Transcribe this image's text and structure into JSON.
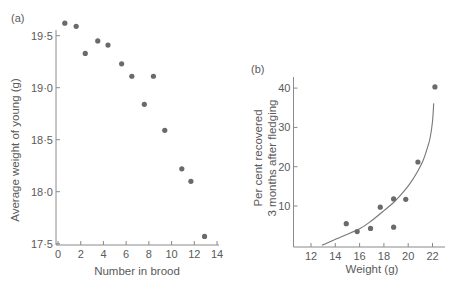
{
  "chart_data": [
    {
      "panel": "(a)",
      "type": "scatter",
      "title": "",
      "xlabel": "Number in brood",
      "ylabel": "Average weight of young (g)",
      "xlim": [
        0,
        14
      ],
      "ylim": [
        17.5,
        19.7
      ],
      "xticks": [
        "0",
        "2",
        "4",
        "6",
        "8",
        "10",
        "12",
        "14"
      ],
      "yticks": [
        "17·5",
        "18·0",
        "18·5",
        "19·0",
        "19·5"
      ],
      "grid": false,
      "legend": null,
      "series": [
        {
          "name": "broods",
          "points": [
            {
              "x": 0.6,
              "y": 19.62
            },
            {
              "x": 1.6,
              "y": 19.59
            },
            {
              "x": 2.4,
              "y": 19.33
            },
            {
              "x": 3.5,
              "y": 19.45
            },
            {
              "x": 4.4,
              "y": 19.41
            },
            {
              "x": 5.6,
              "y": 19.23
            },
            {
              "x": 6.5,
              "y": 19.11
            },
            {
              "x": 7.6,
              "y": 18.84
            },
            {
              "x": 8.4,
              "y": 19.11
            },
            {
              "x": 9.4,
              "y": 18.59
            },
            {
              "x": 10.9,
              "y": 18.22
            },
            {
              "x": 11.7,
              "y": 18.1
            },
            {
              "x": 12.9,
              "y": 17.57
            }
          ]
        }
      ]
    },
    {
      "panel": "(b)",
      "type": "scatter",
      "title": "",
      "xlabel": "Weight (g)",
      "ylabel": "Per cent recovered 3 months after fledging",
      "ylabel_lines": [
        "Per cent recovered",
        "3 months after fledging"
      ],
      "xlim": [
        10.5,
        23.5
      ],
      "ylim": [
        0,
        42
      ],
      "xticks": [
        "12",
        "14",
        "16",
        "18",
        "20",
        "22"
      ],
      "yticks": [
        "10",
        "20",
        "30",
        "40"
      ],
      "grid": false,
      "legend": null,
      "series": [
        {
          "name": "observed",
          "points": [
            {
              "x": 14.9,
              "y": 5.5
            },
            {
              "x": 15.8,
              "y": 3.5
            },
            {
              "x": 16.9,
              "y": 4.3
            },
            {
              "x": 17.7,
              "y": 9.7
            },
            {
              "x": 18.8,
              "y": 11.8
            },
            {
              "x": 18.8,
              "y": 4.6
            },
            {
              "x": 19.8,
              "y": 11.7
            },
            {
              "x": 20.8,
              "y": 21.2
            },
            {
              "x": 22.2,
              "y": 40.3
            }
          ]
        },
        {
          "name": "fitted curve",
          "type": "line",
          "points": [
            {
              "x": 12.9,
              "y": 0
            },
            {
              "x": 14.5,
              "y": 2.2
            },
            {
              "x": 16.0,
              "y": 4.2
            },
            {
              "x": 17.0,
              "y": 6.3
            },
            {
              "x": 18.0,
              "y": 8.8
            },
            {
              "x": 18.8,
              "y": 10.9
            },
            {
              "x": 19.5,
              "y": 13.2
            },
            {
              "x": 20.1,
              "y": 15.5
            },
            {
              "x": 20.7,
              "y": 18.4
            },
            {
              "x": 21.2,
              "y": 21.4
            },
            {
              "x": 21.5,
              "y": 24.0
            },
            {
              "x": 21.8,
              "y": 27.3
            },
            {
              "x": 22.0,
              "y": 31.5
            },
            {
              "x": 22.1,
              "y": 36.1
            }
          ]
        }
      ]
    }
  ],
  "panels": {
    "a": {
      "tag": "(a)",
      "xlabel": "Number in brood",
      "ylabel": "Average weight of young (g)",
      "xticks": [
        "0",
        "2",
        "4",
        "6",
        "8",
        "10",
        "12",
        "14"
      ],
      "yticks": [
        "17·5",
        "18·0",
        "18·5",
        "19·0",
        "19·5"
      ]
    },
    "b": {
      "tag": "(b)",
      "xlabel": "Weight (g)",
      "ylabel_line1": "Per cent recovered",
      "ylabel_line2": "3 months after fledging",
      "xticks": [
        "12",
        "14",
        "16",
        "18",
        "20",
        "22"
      ],
      "yticks": [
        "10",
        "20",
        "30",
        "40"
      ]
    }
  }
}
